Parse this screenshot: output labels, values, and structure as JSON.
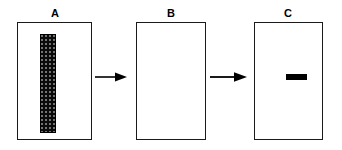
{
  "figure": {
    "type": "three-panel process diagram",
    "background_color": "#ffffff",
    "ink_color": "#000000",
    "panel_border_color": "#1a1a1a"
  },
  "panels": [
    {
      "id": "a",
      "label": "A",
      "content_description": "dark stippled vertical band",
      "band": {
        "name": "stippled-vertical-band",
        "orientation": "vertical",
        "fill": "#0a0a0a",
        "texture": "stippled"
      }
    },
    {
      "id": "b",
      "label": "B",
      "content_description": "empty panel",
      "band": null
    },
    {
      "id": "c",
      "label": "C",
      "content_description": "solid horizontal band",
      "band": {
        "name": "solid-horizontal-band",
        "orientation": "horizontal",
        "fill": "#000000",
        "texture": "solid"
      }
    }
  ],
  "arrows": [
    {
      "id": "arrow-1",
      "from": "A",
      "to": "B",
      "direction": "right",
      "color": "#000000"
    },
    {
      "id": "arrow-2",
      "from": "B",
      "to": "C",
      "direction": "right",
      "color": "#000000"
    }
  ]
}
